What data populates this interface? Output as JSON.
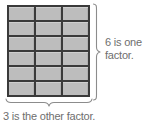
{
  "figure": {
    "type": "area-model-array",
    "rows": 6,
    "columns": 3,
    "total_cells": 18,
    "cell_fill_color": "#bdbdbd",
    "cell_border_color": "#3a3a3a",
    "brace_color": "#8c8c8c",
    "label_color": "#6e6e6e",
    "background_color": "#ffffff"
  },
  "labels": {
    "vertical": {
      "line1": "6 is one",
      "line2": "factor.",
      "full_text": "6 is one factor.",
      "value": "6",
      "position": "right"
    },
    "horizontal": {
      "line1": "3 is the other factor.",
      "full_text": "3 is the other factor.",
      "value": "3",
      "position": "bottom"
    }
  },
  "braces": {
    "right": {
      "name": "vertical-brace",
      "spans": "rows"
    },
    "bottom": {
      "name": "horizontal-brace",
      "spans": "columns"
    }
  }
}
